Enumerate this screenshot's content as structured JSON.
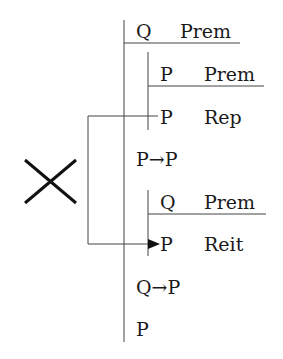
{
  "diagram": {
    "type": "fitch-proof",
    "invalid_marker": "X",
    "lines": [
      {
        "formula": "Q",
        "justification": "Prem",
        "depth": 0
      },
      {
        "formula": "P",
        "justification": "Prem",
        "depth": 1
      },
      {
        "formula": "P",
        "justification": "Rep",
        "depth": 1
      },
      {
        "formula": "P→P",
        "justification": "",
        "depth": 0
      },
      {
        "formula": "Q",
        "justification": "Prem",
        "depth": 1
      },
      {
        "formula": "P",
        "justification": "Reit",
        "depth": 1
      },
      {
        "formula": "Q→P",
        "justification": "",
        "depth": 0
      },
      {
        "formula": "P",
        "justification": "",
        "depth": 0
      }
    ],
    "arrow": {
      "from_line": 3,
      "to_line": 6,
      "label": "illegal reiteration"
    }
  }
}
